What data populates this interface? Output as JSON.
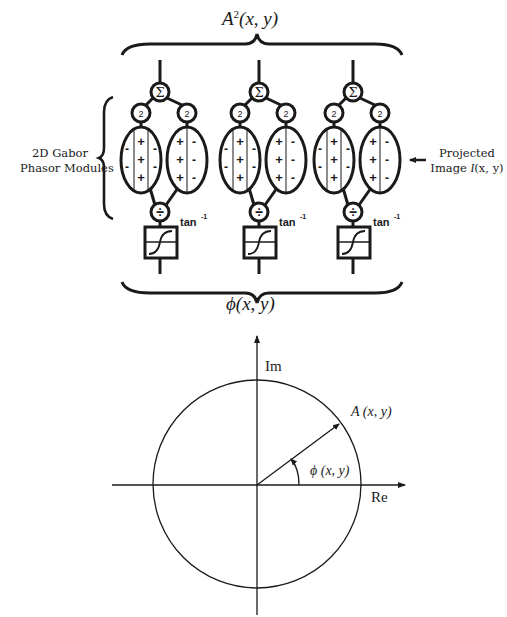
{
  "diagram": {
    "top_label": {
      "base": "A",
      "sup": "2",
      "args": "(x, y)"
    },
    "bottom_label": {
      "symbol": "ϕ",
      "args": "(x, y)"
    },
    "left_label": {
      "line1": "2D Gabor",
      "line2": "Phasor Modules"
    },
    "right_label": {
      "line1": "Projected",
      "line2_text": "Image ",
      "line2_math": "I",
      "line2_args": "(x, y)"
    },
    "module_symbols": {
      "sum": "Σ",
      "square": "2",
      "divide": "÷",
      "arctan_base": "tan",
      "arctan_sup": "-1"
    },
    "modules": [
      {
        "id": 1,
        "even_filter": {
          "columns": [
            "-",
            "+",
            "-"
          ]
        },
        "odd_filter": {
          "columns": [
            "+",
            "-"
          ]
        }
      },
      {
        "id": 2,
        "even_filter": {
          "columns": [
            "-",
            "+",
            "-"
          ]
        },
        "odd_filter": {
          "columns": [
            "+",
            "-"
          ]
        }
      },
      {
        "id": 3,
        "even_filter": {
          "columns": [
            "-",
            "+",
            "-"
          ]
        },
        "odd_filter": {
          "columns": [
            "+",
            "-"
          ]
        }
      }
    ],
    "phasor_plot": {
      "axis_x_label": "Re",
      "axis_y_label": "Im",
      "amplitude_label": "A (x, y)",
      "phase_label": "ϕ (x, y)"
    },
    "colors": {
      "ink": "#1a1a1a",
      "background": "#ffffff"
    }
  }
}
